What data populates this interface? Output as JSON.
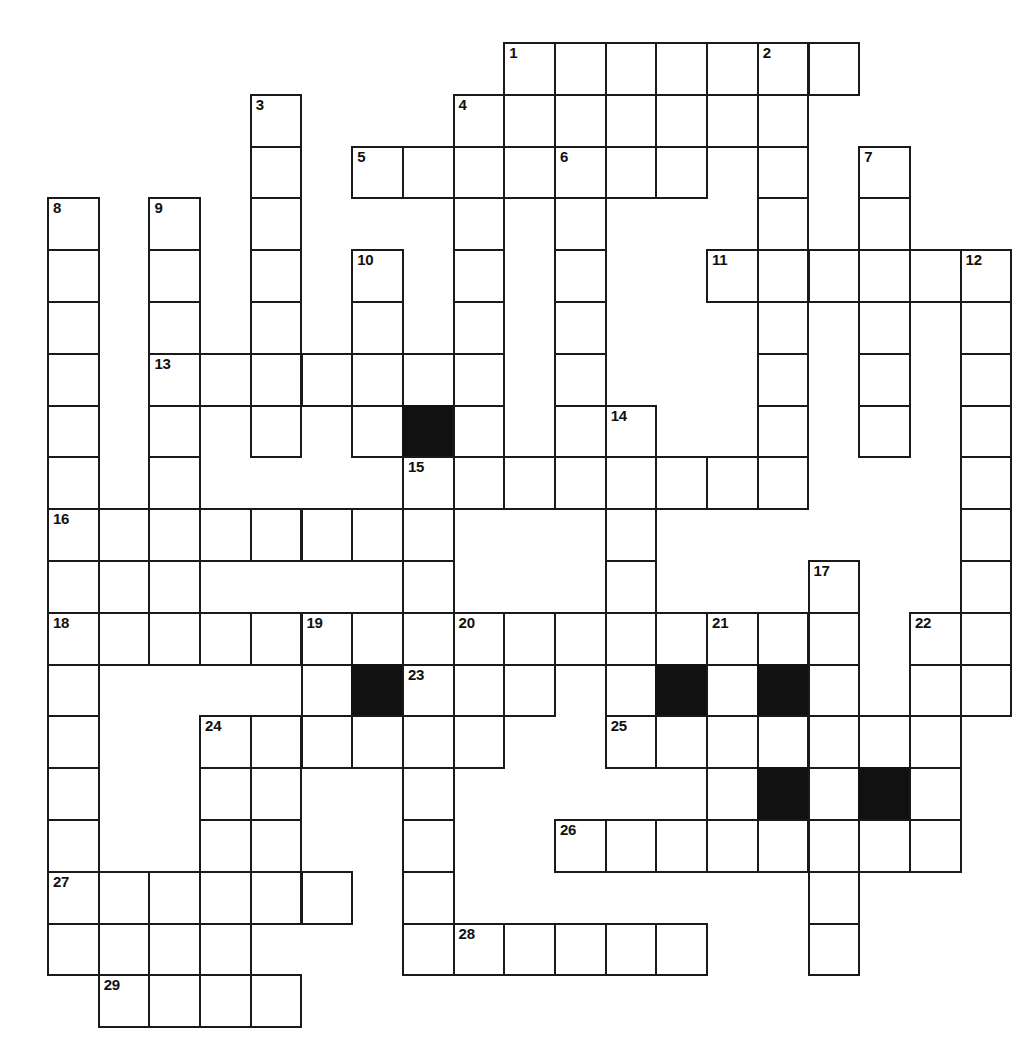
{
  "puzzle": {
    "title": "",
    "geometry": {
      "origin_x": 47,
      "origin_y": 42,
      "cell_width": 50.7,
      "cell_height": 51.8,
      "columns": 20,
      "rows": 20
    },
    "colors": {
      "grid_line": "#1a1a1a",
      "cell_fill": "#ffffff",
      "block_fill": "#111111",
      "number_text": "#111111",
      "page_background": "#ffffff"
    },
    "counts": {
      "numbered_clues": 29,
      "block_cells": 7
    },
    "numbers": [
      {
        "n": "1",
        "col": 9,
        "row": 0
      },
      {
        "n": "2",
        "col": 14,
        "row": 0
      },
      {
        "n": "3",
        "col": 4,
        "row": 1
      },
      {
        "n": "4",
        "col": 8,
        "row": 1
      },
      {
        "n": "5",
        "col": 6,
        "row": 2
      },
      {
        "n": "6",
        "col": 10,
        "row": 2
      },
      {
        "n": "7",
        "col": 16,
        "row": 2
      },
      {
        "n": "8",
        "col": 0,
        "row": 3
      },
      {
        "n": "9",
        "col": 2,
        "row": 3
      },
      {
        "n": "10",
        "col": 6,
        "row": 4
      },
      {
        "n": "11",
        "col": 13,
        "row": 4
      },
      {
        "n": "12",
        "col": 18,
        "row": 4
      },
      {
        "n": "13",
        "col": 2,
        "row": 6
      },
      {
        "n": "14",
        "col": 11,
        "row": 7
      },
      {
        "n": "15",
        "col": 7,
        "row": 8
      },
      {
        "n": "16",
        "col": 0,
        "row": 9
      },
      {
        "n": "17",
        "col": 15,
        "row": 10
      },
      {
        "n": "18",
        "col": 0,
        "row": 11
      },
      {
        "n": "19",
        "col": 5,
        "row": 11
      },
      {
        "n": "20",
        "col": 8,
        "row": 11
      },
      {
        "n": "21",
        "col": 13,
        "row": 11
      },
      {
        "n": "22",
        "col": 17,
        "row": 11
      },
      {
        "n": "23",
        "col": 7,
        "row": 12
      },
      {
        "n": "24",
        "col": 3,
        "row": 13
      },
      {
        "n": "25",
        "col": 11,
        "row": 13
      },
      {
        "n": "26",
        "col": 10,
        "row": 15
      },
      {
        "n": "27",
        "col": 0,
        "row": 16
      },
      {
        "n": "28",
        "col": 8,
        "row": 17
      },
      {
        "n": "29",
        "col": 1,
        "row": 18
      }
    ],
    "blocks": [
      {
        "col": 7,
        "row": 7
      },
      {
        "col": 6,
        "row": 12
      },
      {
        "col": 12,
        "row": 12
      },
      {
        "col": 14,
        "row": 12
      },
      {
        "col": 14,
        "row": 14
      },
      {
        "col": 16,
        "row": 14
      }
    ],
    "cells": [
      {
        "col": 9,
        "row": 0
      },
      {
        "col": 10,
        "row": 0
      },
      {
        "col": 11,
        "row": 0
      },
      {
        "col": 12,
        "row": 0
      },
      {
        "col": 13,
        "row": 0
      },
      {
        "col": 14,
        "row": 0
      },
      {
        "col": 15,
        "row": 0
      },
      {
        "col": 4,
        "row": 1
      },
      {
        "col": 8,
        "row": 1
      },
      {
        "col": 9,
        "row": 1
      },
      {
        "col": 10,
        "row": 1
      },
      {
        "col": 11,
        "row": 1
      },
      {
        "col": 12,
        "row": 1
      },
      {
        "col": 13,
        "row": 1
      },
      {
        "col": 14,
        "row": 1
      },
      {
        "col": 4,
        "row": 2
      },
      {
        "col": 6,
        "row": 2
      },
      {
        "col": 7,
        "row": 2
      },
      {
        "col": 8,
        "row": 2
      },
      {
        "col": 9,
        "row": 2
      },
      {
        "col": 10,
        "row": 2
      },
      {
        "col": 11,
        "row": 2
      },
      {
        "col": 12,
        "row": 2
      },
      {
        "col": 14,
        "row": 2
      },
      {
        "col": 16,
        "row": 2
      },
      {
        "col": 0,
        "row": 3
      },
      {
        "col": 2,
        "row": 3
      },
      {
        "col": 4,
        "row": 3
      },
      {
        "col": 8,
        "row": 3
      },
      {
        "col": 10,
        "row": 3
      },
      {
        "col": 14,
        "row": 3
      },
      {
        "col": 16,
        "row": 3
      },
      {
        "col": 0,
        "row": 4
      },
      {
        "col": 2,
        "row": 4
      },
      {
        "col": 4,
        "row": 4
      },
      {
        "col": 6,
        "row": 4
      },
      {
        "col": 8,
        "row": 4
      },
      {
        "col": 10,
        "row": 4
      },
      {
        "col": 13,
        "row": 4
      },
      {
        "col": 14,
        "row": 4
      },
      {
        "col": 15,
        "row": 4
      },
      {
        "col": 16,
        "row": 4
      },
      {
        "col": 17,
        "row": 4
      },
      {
        "col": 18,
        "row": 4
      },
      {
        "col": 0,
        "row": 5
      },
      {
        "col": 2,
        "row": 5
      },
      {
        "col": 4,
        "row": 5
      },
      {
        "col": 6,
        "row": 5
      },
      {
        "col": 8,
        "row": 5
      },
      {
        "col": 10,
        "row": 5
      },
      {
        "col": 14,
        "row": 5
      },
      {
        "col": 16,
        "row": 5
      },
      {
        "col": 18,
        "row": 5
      },
      {
        "col": 0,
        "row": 6
      },
      {
        "col": 2,
        "row": 6
      },
      {
        "col": 3,
        "row": 6
      },
      {
        "col": 4,
        "row": 6
      },
      {
        "col": 5,
        "row": 6
      },
      {
        "col": 6,
        "row": 6
      },
      {
        "col": 7,
        "row": 6
      },
      {
        "col": 8,
        "row": 6
      },
      {
        "col": 10,
        "row": 6
      },
      {
        "col": 14,
        "row": 6
      },
      {
        "col": 16,
        "row": 6
      },
      {
        "col": 18,
        "row": 6
      },
      {
        "col": 0,
        "row": 7
      },
      {
        "col": 2,
        "row": 7
      },
      {
        "col": 4,
        "row": 7
      },
      {
        "col": 6,
        "row": 7
      },
      {
        "col": 7,
        "row": 7
      },
      {
        "col": 8,
        "row": 7
      },
      {
        "col": 10,
        "row": 7
      },
      {
        "col": 11,
        "row": 7
      },
      {
        "col": 14,
        "row": 7
      },
      {
        "col": 16,
        "row": 7
      },
      {
        "col": 18,
        "row": 7
      },
      {
        "col": 0,
        "row": 8
      },
      {
        "col": 2,
        "row": 8
      },
      {
        "col": 7,
        "row": 8
      },
      {
        "col": 8,
        "row": 8
      },
      {
        "col": 9,
        "row": 8
      },
      {
        "col": 10,
        "row": 8
      },
      {
        "col": 11,
        "row": 8
      },
      {
        "col": 12,
        "row": 8
      },
      {
        "col": 13,
        "row": 8
      },
      {
        "col": 14,
        "row": 8
      },
      {
        "col": 18,
        "row": 8
      },
      {
        "col": 0,
        "row": 9
      },
      {
        "col": 1,
        "row": 9
      },
      {
        "col": 2,
        "row": 9
      },
      {
        "col": 3,
        "row": 9
      },
      {
        "col": 4,
        "row": 9
      },
      {
        "col": 5,
        "row": 9
      },
      {
        "col": 6,
        "row": 9
      },
      {
        "col": 7,
        "row": 9
      },
      {
        "col": 11,
        "row": 9
      },
      {
        "col": 18,
        "row": 9
      },
      {
        "col": 0,
        "row": 10
      },
      {
        "col": 2,
        "row": 10
      },
      {
        "col": 7,
        "row": 10
      },
      {
        "col": 11,
        "row": 10
      },
      {
        "col": 15,
        "row": 10
      },
      {
        "col": 18,
        "row": 10
      },
      {
        "col": 0,
        "row": 11
      },
      {
        "col": 1,
        "row": 11
      },
      {
        "col": 2,
        "row": 11
      },
      {
        "col": 3,
        "row": 11
      },
      {
        "col": 4,
        "row": 11
      },
      {
        "col": 5,
        "row": 11
      },
      {
        "col": 6,
        "row": 11
      },
      {
        "col": 8,
        "row": 11
      },
      {
        "col": 9,
        "row": 11
      },
      {
        "col": 10,
        "row": 11
      },
      {
        "col": 11,
        "row": 11
      },
      {
        "col": 12,
        "row": 11
      },
      {
        "col": 13,
        "row": 11
      },
      {
        "col": 14,
        "row": 11
      },
      {
        "col": 15,
        "row": 11
      },
      {
        "col": 17,
        "row": 11
      },
      {
        "col": 18,
        "row": 11
      },
      {
        "col": 0,
        "row": 12
      },
      {
        "col": 5,
        "row": 12
      },
      {
        "col": 6,
        "row": 12
      },
      {
        "col": 7,
        "row": 12
      },
      {
        "col": 8,
        "row": 12
      },
      {
        "col": 9,
        "row": 12
      },
      {
        "col": 11,
        "row": 12
      },
      {
        "col": 12,
        "row": 12
      },
      {
        "col": 13,
        "row": 12
      },
      {
        "col": 14,
        "row": 12
      },
      {
        "col": 15,
        "row": 12
      },
      {
        "col": 17,
        "row": 12
      },
      {
        "col": 18,
        "row": 12
      },
      {
        "col": 0,
        "row": 13
      },
      {
        "col": 3,
        "row": 13
      },
      {
        "col": 4,
        "row": 13
      },
      {
        "col": 5,
        "row": 13
      },
      {
        "col": 6,
        "row": 13
      },
      {
        "col": 7,
        "row": 13
      },
      {
        "col": 8,
        "row": 13
      },
      {
        "col": 11,
        "row": 13
      },
      {
        "col": 12,
        "row": 13
      },
      {
        "col": 13,
        "row": 13
      },
      {
        "col": 14,
        "row": 13
      },
      {
        "col": 15,
        "row": 13
      },
      {
        "col": 16,
        "row": 13
      },
      {
        "col": 17,
        "row": 13
      },
      {
        "col": 0,
        "row": 14
      },
      {
        "col": 3,
        "row": 14
      },
      {
        "col": 4,
        "row": 14
      },
      {
        "col": 7,
        "row": 14
      },
      {
        "col": 13,
        "row": 14
      },
      {
        "col": 14,
        "row": 14
      },
      {
        "col": 15,
        "row": 14
      },
      {
        "col": 16,
        "row": 14
      },
      {
        "col": 17,
        "row": 14
      },
      {
        "col": 0,
        "row": 15
      },
      {
        "col": 3,
        "row": 15
      },
      {
        "col": 4,
        "row": 15
      },
      {
        "col": 7,
        "row": 15
      },
      {
        "col": 10,
        "row": 15
      },
      {
        "col": 11,
        "row": 15
      },
      {
        "col": 12,
        "row": 15
      },
      {
        "col": 13,
        "row": 15
      },
      {
        "col": 14,
        "row": 15
      },
      {
        "col": 15,
        "row": 15
      },
      {
        "col": 16,
        "row": 15
      },
      {
        "col": 17,
        "row": 15
      },
      {
        "col": 0,
        "row": 16
      },
      {
        "col": 1,
        "row": 16
      },
      {
        "col": 2,
        "row": 16
      },
      {
        "col": 3,
        "row": 16
      },
      {
        "col": 4,
        "row": 16
      },
      {
        "col": 5,
        "row": 16
      },
      {
        "col": 7,
        "row": 16
      },
      {
        "col": 15,
        "row": 16
      },
      {
        "col": 0,
        "row": 17
      },
      {
        "col": 1,
        "row": 17
      },
      {
        "col": 2,
        "row": 17
      },
      {
        "col": 3,
        "row": 17
      },
      {
        "col": 7,
        "row": 17
      },
      {
        "col": 8,
        "row": 17
      },
      {
        "col": 9,
        "row": 17
      },
      {
        "col": 10,
        "row": 17
      },
      {
        "col": 11,
        "row": 17
      },
      {
        "col": 12,
        "row": 17
      },
      {
        "col": 15,
        "row": 17
      },
      {
        "col": 1,
        "row": 18
      },
      {
        "col": 2,
        "row": 18
      },
      {
        "col": 3,
        "row": 18
      },
      {
        "col": 4,
        "row": 18
      }
    ]
  }
}
